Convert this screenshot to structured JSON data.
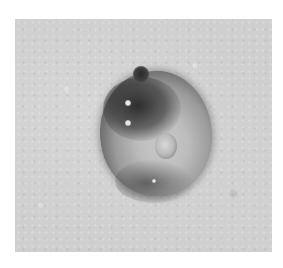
{
  "image": {
    "kind": "grayscale micrograph",
    "subject": "single rounded cell with dark granular rim and pale central region",
    "colors": {
      "page_background": "#ffffff",
      "field_background": "#cfcfcf",
      "cell_rim": "#3a3a3a",
      "cell_center": "#c9c9c9"
    }
  }
}
